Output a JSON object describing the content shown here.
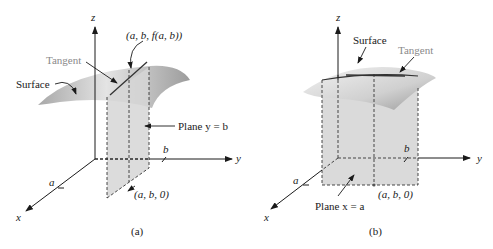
{
  "figure_a": {
    "caption": "(a)",
    "axis_z": "z",
    "axis_y": "y",
    "axis_x": "x",
    "tick_a": "a",
    "tick_b": "b",
    "label_point": "(a, b, f(a, b))",
    "label_tangent": "Tangent",
    "label_surface": "Surface",
    "label_plane": "Plane y = b",
    "label_base_point": "(a, b, 0)"
  },
  "figure_b": {
    "caption": "(b)",
    "axis_z": "z",
    "axis_y": "y",
    "axis_x": "x",
    "tick_a": "a",
    "tick_b": "b",
    "label_tangent": "Tangent",
    "label_surface": "Surface",
    "label_plane": "Plane x = a",
    "label_base_point": "(a, b, 0)"
  },
  "colors": {
    "surface_light": "#e6e6e6",
    "surface_dark": "#9a9a9a",
    "plane_fill": "#d6d6d6",
    "axis": "#1a1a1a",
    "tangent_label": "#8a8a8a"
  }
}
